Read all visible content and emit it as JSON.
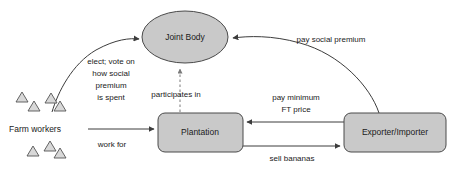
{
  "diagram": {
    "colors": {
      "node_fill": "#c9c9c9",
      "node_stroke": "#4a4a4a",
      "edge_stroke": "#3c3c3c",
      "dashed_edge_stroke": "#7a7a7a",
      "worker_fill": "#d8d8d8",
      "background": "#ffffff"
    },
    "nodes": [
      {
        "id": "joint-body",
        "label": "Joint Body",
        "shape": "ellipse"
      },
      {
        "id": "plantation",
        "label": "Plantation",
        "shape": "rounded-rect"
      },
      {
        "id": "exporter-importer",
        "label": "Exporter/Importer",
        "shape": "rounded-rect"
      },
      {
        "id": "farm-workers",
        "label": "Farm workers",
        "shape": "triangle-group"
      }
    ],
    "edges": [
      {
        "id": "elect-vote",
        "from": "farm-workers",
        "to": "joint-body",
        "style": "curved-solid",
        "label_lines": [
          "elect; vote on",
          "how social",
          "premium",
          "is spent"
        ]
      },
      {
        "id": "pay-social-premium",
        "from": "exporter-importer",
        "to": "joint-body",
        "style": "curved-solid",
        "label_lines": [
          "pay social premium"
        ]
      },
      {
        "id": "participates-in",
        "from": "plantation",
        "to": "joint-body",
        "style": "dashed",
        "label_lines": [
          "participates in"
        ]
      },
      {
        "id": "work-for",
        "from": "farm-workers",
        "to": "plantation",
        "style": "straight-solid",
        "label_lines": [
          "work for"
        ]
      },
      {
        "id": "pay-minimum-ft-price",
        "from": "exporter-importer",
        "to": "plantation",
        "style": "straight-solid",
        "label_lines": [
          "pay minimum",
          "FT price"
        ]
      },
      {
        "id": "sell-bananas",
        "from": "plantation",
        "to": "exporter-importer",
        "style": "straight-solid",
        "label_lines": [
          "sell bananas"
        ]
      }
    ]
  }
}
